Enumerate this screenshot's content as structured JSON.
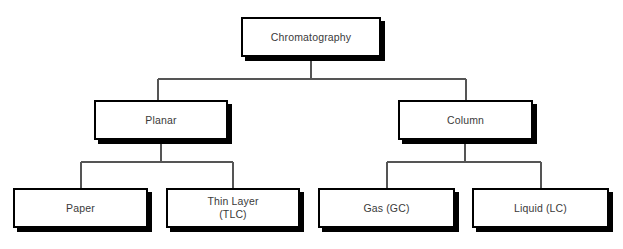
{
  "diagram": {
    "type": "hierarchy-tree",
    "orientation": "top-down",
    "background_color": "#ffffff",
    "box_border_color": "#000000",
    "box_fill_color": "#ffffff",
    "shadow_color": "#000000",
    "connector_color": "#555555",
    "text_color": "#3a3a3a",
    "levels": 3,
    "nodes": {
      "root": {
        "label": "Chromatography",
        "level": 1
      },
      "planar": {
        "label": "Planar",
        "level": 2
      },
      "column": {
        "label": "Column",
        "level": 2
      },
      "paper": {
        "label": "Paper",
        "level": 3
      },
      "thin_layer": {
        "label": "Thin Layer\n(TLC)",
        "level": 3
      },
      "gas": {
        "label": "Gas (GC)",
        "level": 3
      },
      "liquid": {
        "label": "Liquid (LC)",
        "level": 3
      }
    },
    "edges": [
      {
        "from": "root",
        "to": "planar"
      },
      {
        "from": "root",
        "to": "column"
      },
      {
        "from": "planar",
        "to": "paper"
      },
      {
        "from": "planar",
        "to": "thin_layer"
      },
      {
        "from": "column",
        "to": "gas"
      },
      {
        "from": "column",
        "to": "liquid"
      }
    ]
  }
}
